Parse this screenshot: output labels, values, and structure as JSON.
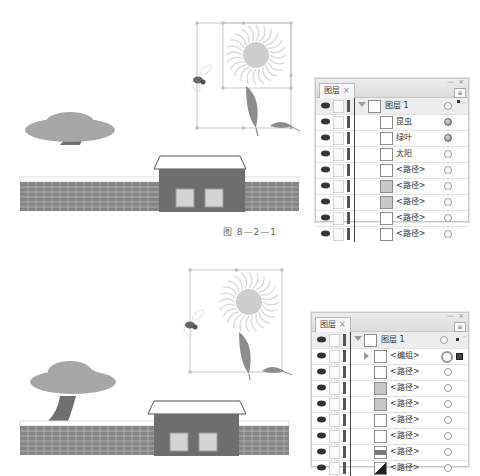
{
  "figure_caption": "图 8—2—1",
  "colors": {
    "panel_bg": "#f4f4f4",
    "panel_header": "#dcdcdc",
    "wall": "#7f7f7f",
    "house": "#6e6e6e",
    "tree_canopy": "#a6a6a6",
    "sun": "#cfcfcf"
  },
  "panel_top": {
    "tab_label": "图层",
    "tab_close": "×",
    "window_buttons": "— ×",
    "menu_icon": "≡",
    "layers": [
      {
        "label": "图层 1",
        "level": 0,
        "expanded": true,
        "target": "empty",
        "selected_indicator": true,
        "thumb": "layer-thumb-icon"
      },
      {
        "label": "昆虫",
        "level": 1,
        "target": "filled",
        "thumb": "insect-thumb-icon"
      },
      {
        "label": "绿叶",
        "level": 1,
        "target": "filled",
        "thumb": "leaf-thumb-icon"
      },
      {
        "label": "太阳",
        "level": 1,
        "target": "empty",
        "thumb": "sun-thumb-icon"
      },
      {
        "label": "<路径>",
        "level": 1,
        "target": "empty",
        "thumb": "cloud-path-thumb-icon"
      },
      {
        "label": "<路径>",
        "level": 1,
        "target": "empty",
        "thumb": "gray-path-thumb-icon"
      },
      {
        "label": "<路径>",
        "level": 1,
        "target": "empty",
        "thumb": "gray-path-thumb-icon"
      },
      {
        "label": "<路径>",
        "level": 1,
        "target": "empty",
        "thumb": "white-path-thumb-icon"
      },
      {
        "label": "<路径>",
        "level": 1,
        "target": "empty",
        "thumb": "white-path-thumb-icon"
      }
    ]
  },
  "panel_bottom": {
    "tab_label": "图层",
    "tab_close": "×",
    "window_buttons": "— ×",
    "menu_icon": "≡",
    "layers": [
      {
        "label": "图层 1",
        "level": 0,
        "expanded": true,
        "target": "empty",
        "selected_indicator": true,
        "thumb": "layer-thumb-icon"
      },
      {
        "label": "<编组>",
        "level": 1,
        "collapsed_group": true,
        "target": "big",
        "selected_square": true,
        "thumb": "group-thumb-icon"
      },
      {
        "label": "<路径>",
        "level": 1,
        "target": "empty",
        "thumb": "cloud-path-thumb-icon"
      },
      {
        "label": "<路径>",
        "level": 1,
        "target": "empty",
        "thumb": "gray-path-thumb-icon"
      },
      {
        "label": "<路径>",
        "level": 1,
        "target": "empty",
        "thumb": "gray-path-thumb-icon"
      },
      {
        "label": "<路径>",
        "level": 1,
        "target": "empty",
        "thumb": "white-path-thumb-icon"
      },
      {
        "label": "<路径>",
        "level": 1,
        "target": "empty",
        "thumb": "white-path-thumb-icon"
      },
      {
        "label": "<路径>",
        "level": 1,
        "target": "empty",
        "thumb": "striped-path-thumb-icon"
      },
      {
        "label": "<路径>",
        "level": 1,
        "target": "empty",
        "thumb": "black-triangle-path-thumb-icon"
      }
    ]
  }
}
